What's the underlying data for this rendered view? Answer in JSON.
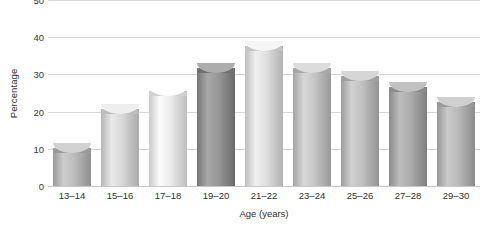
{
  "chart_data": {
    "type": "bar",
    "title": "",
    "xlabel": "Age (years)",
    "ylabel": "Percentage",
    "categories": [
      "13–14",
      "15–16",
      "17–18",
      "19–20",
      "21–22",
      "23–24",
      "25–26",
      "27–28",
      "29–30"
    ],
    "values": [
      11.5,
      22,
      27,
      33,
      39,
      33,
      31,
      28,
      24
    ],
    "ylim": [
      0,
      50
    ],
    "yticks": [
      0,
      10,
      20,
      30,
      40,
      50
    ],
    "ytick_labels": [
      "0",
      "10",
      "20",
      "30",
      "40",
      "50"
    ],
    "grid": true,
    "legend": "none",
    "bar_colors": [
      "#b3b3b3",
      "#cfcfcf",
      "#e2e2e2",
      "#8e8e8e",
      "#d6d6d6",
      "#bdbdbd",
      "#b7b7b7",
      "#a3a3a3",
      "#b0b0b0"
    ],
    "bar_top_colors": [
      "#9a9a9a",
      "#bcbcbc",
      "#d2d2d2",
      "#6f6f6f",
      "#c4c4c4",
      "#a8a8a8",
      "#a0a0a0",
      "#8c8c8c",
      "#999999"
    ],
    "grid_color": "#d8d8d8",
    "axis_color": "#c9c9c9",
    "text_color": "#2f2f2f",
    "background": "#ffffff"
  }
}
